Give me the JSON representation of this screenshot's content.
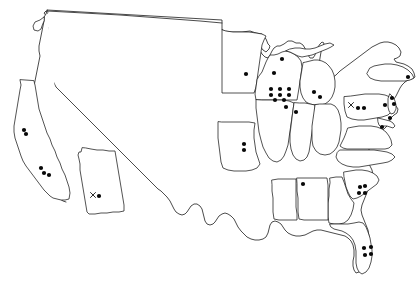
{
  "map": {
    "title": "United States point-distribution map",
    "region": "Contiguous United States",
    "projection_note": "Outline map of the contiguous United States with selected state boundaries drawn",
    "background_color": "#ffffff",
    "outline_color": "#1a1a1a",
    "marker_color": "#080808",
    "marker_shapes": {
      "dot": "filled-circle",
      "cross": "x-mark"
    },
    "marker_radius_px": 2.1,
    "outlined_states": [
      "Washington",
      "California",
      "Arizona",
      "Minnesota",
      "Wisconsin",
      "Michigan",
      "Illinois",
      "Indiana",
      "Ohio",
      "Missouri",
      "Pennsylvania",
      "New Jersey",
      "Maryland",
      "Delaware",
      "Virginia",
      "North Carolina",
      "South Carolina",
      "Georgia",
      "Alabama",
      "Mississippi",
      "Florida",
      "New York"
    ],
    "marker_totals": {
      "dots": 37,
      "crosses": 2,
      "total": 39
    },
    "markers": [
      {
        "id": "ca-n-1",
        "shape": "dot",
        "x": 24,
        "y": 130,
        "region": "Northern California"
      },
      {
        "id": "ca-n-2",
        "shape": "dot",
        "x": 26,
        "y": 134,
        "region": "Northern California"
      },
      {
        "id": "ca-s-1",
        "shape": "dot",
        "x": 41,
        "y": 168,
        "region": "Southern California"
      },
      {
        "id": "ca-s-2",
        "shape": "dot",
        "x": 44,
        "y": 173,
        "region": "Southern California"
      },
      {
        "id": "ca-s-3",
        "shape": "dot",
        "x": 49,
        "y": 175,
        "region": "Southern California"
      },
      {
        "id": "az-x",
        "shape": "cross",
        "x": 93,
        "y": 195,
        "region": "Arizona"
      },
      {
        "id": "az-1",
        "shape": "dot",
        "x": 99,
        "y": 196,
        "region": "Arizona"
      },
      {
        "id": "mn-1",
        "shape": "dot",
        "x": 246,
        "y": 74,
        "region": "Minnesota"
      },
      {
        "id": "wi-1",
        "shape": "dot",
        "x": 274,
        "y": 73,
        "region": "Wisconsin"
      },
      {
        "id": "wi-2",
        "shape": "dot",
        "x": 282,
        "y": 59,
        "region": "Wisconsin"
      },
      {
        "id": "il-g-1",
        "shape": "dot",
        "x": 271,
        "y": 89,
        "region": "Northern Illinois"
      },
      {
        "id": "il-g-2",
        "shape": "dot",
        "x": 280,
        "y": 89,
        "region": "Northern Illinois"
      },
      {
        "id": "il-g-3",
        "shape": "dot",
        "x": 289,
        "y": 89,
        "region": "Northern Illinois"
      },
      {
        "id": "il-g-4",
        "shape": "dot",
        "x": 271,
        "y": 95,
        "region": "Northern Illinois"
      },
      {
        "id": "il-g-5",
        "shape": "dot",
        "x": 280,
        "y": 95,
        "region": "Northern Illinois"
      },
      {
        "id": "il-g-6",
        "shape": "dot",
        "x": 289,
        "y": 95,
        "region": "Northern Illinois"
      },
      {
        "id": "il-g-7",
        "shape": "dot",
        "x": 275,
        "y": 100,
        "region": "Northern Illinois"
      },
      {
        "id": "il-g-8",
        "shape": "dot",
        "x": 284,
        "y": 100,
        "region": "Northern Illinois"
      },
      {
        "id": "il-c-1",
        "shape": "dot",
        "x": 286,
        "y": 107,
        "region": "Central Illinois"
      },
      {
        "id": "in-1",
        "shape": "dot",
        "x": 296,
        "y": 112,
        "region": "Indiana"
      },
      {
        "id": "mi-1",
        "shape": "dot",
        "x": 314,
        "y": 92,
        "region": "Michigan"
      },
      {
        "id": "mi-2",
        "shape": "dot",
        "x": 320,
        "y": 97,
        "region": "Michigan"
      },
      {
        "id": "mo-1",
        "shape": "dot",
        "x": 244,
        "y": 144,
        "region": "Missouri"
      },
      {
        "id": "mo-2",
        "shape": "dot",
        "x": 244,
        "y": 150,
        "region": "Missouri"
      },
      {
        "id": "pa-x",
        "shape": "cross",
        "x": 351,
        "y": 105,
        "region": "Western Pennsylvania"
      },
      {
        "id": "pa-1",
        "shape": "dot",
        "x": 358,
        "y": 108,
        "region": "Pennsylvania"
      },
      {
        "id": "pa-2",
        "shape": "dot",
        "x": 364,
        "y": 108,
        "region": "Pennsylvania"
      },
      {
        "id": "pa-e-1",
        "shape": "dot",
        "x": 385,
        "y": 105,
        "region": "Eastern Pennsylvania"
      },
      {
        "id": "nj-1",
        "shape": "dot",
        "x": 392,
        "y": 98,
        "region": "New Jersey"
      },
      {
        "id": "nj-2",
        "shape": "dot",
        "x": 394,
        "y": 104,
        "region": "New Jersey"
      },
      {
        "id": "ny-1",
        "shape": "dot",
        "x": 408,
        "y": 77,
        "region": "New York"
      },
      {
        "id": "md-1",
        "shape": "dot",
        "x": 390,
        "y": 118,
        "region": "Maryland"
      },
      {
        "id": "va-1",
        "shape": "dot",
        "x": 382,
        "y": 127,
        "region": "Virginia"
      },
      {
        "id": "al-1",
        "shape": "dot",
        "x": 303,
        "y": 184,
        "region": "Alabama"
      },
      {
        "id": "sc-1",
        "shape": "dot",
        "x": 360,
        "y": 187,
        "region": "South Carolina"
      },
      {
        "id": "sc-2",
        "shape": "dot",
        "x": 365,
        "y": 186,
        "region": "South Carolina"
      },
      {
        "id": "sc-3",
        "shape": "dot",
        "x": 359,
        "y": 193,
        "region": "South Carolina"
      },
      {
        "id": "sc-4",
        "shape": "dot",
        "x": 365,
        "y": 193,
        "region": "South Carolina"
      },
      {
        "id": "fl-1",
        "shape": "dot",
        "x": 364,
        "y": 248,
        "region": "Florida"
      },
      {
        "id": "fl-2",
        "shape": "dot",
        "x": 371,
        "y": 247,
        "region": "Florida"
      },
      {
        "id": "fl-3",
        "shape": "dot",
        "x": 365,
        "y": 255,
        "region": "Florida"
      },
      {
        "id": "fl-4",
        "shape": "dot",
        "x": 371,
        "y": 254,
        "region": "Florida"
      }
    ]
  }
}
